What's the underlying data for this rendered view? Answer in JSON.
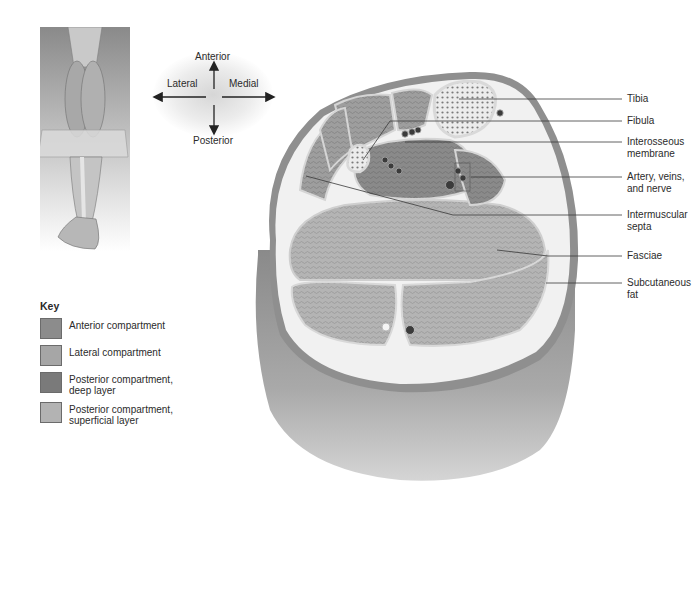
{
  "orientation": {
    "anterior": "Anterior",
    "lateral": "Lateral",
    "medial": "Medial",
    "posterior": "Posterior"
  },
  "structure_labels": [
    {
      "id": "tibia",
      "text": "Tibia"
    },
    {
      "id": "fibula",
      "text": "Fibula"
    },
    {
      "id": "interosseous",
      "text": "Interosseous membrane"
    },
    {
      "id": "vessels",
      "text": "Artery, veins, and nerve"
    },
    {
      "id": "septa",
      "text": "Intermuscular septa"
    },
    {
      "id": "fasciae",
      "text": "Fasciae"
    },
    {
      "id": "fat",
      "text": "Subcutaneous fat"
    }
  ],
  "key": {
    "title": "Key",
    "items": [
      {
        "label": "Anterior compartment",
        "color": "#8c8c8c"
      },
      {
        "label": "Lateral compartment",
        "color": "#a6a6a6"
      },
      {
        "label": "Posterior compartment, deep layer",
        "color": "#7a7a7a"
      },
      {
        "label": "Posterior compartment, superficial layer",
        "color": "#b3b3b3"
      }
    ]
  },
  "colors": {
    "skin_rim": "#8f8f8f",
    "fat": "#efefef",
    "muscle": "#9c9c9c",
    "bone": "#e6e6e6",
    "leader_line": "#3a3a3a"
  }
}
